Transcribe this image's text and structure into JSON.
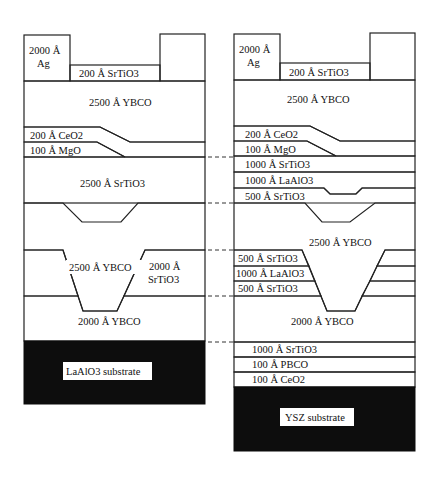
{
  "colors": {
    "hatch": "#555555",
    "substrate": "#0d0d0d",
    "background": "#ffffff",
    "line": "#222222"
  },
  "left_stack": {
    "ag": "2000 Å",
    "ag_material": "Ag",
    "top_srtio3": "200 Å SrTiO3",
    "top_ybco": "2500 Å YBCO",
    "ceo2": "200 Å CeO2",
    "mgo": "100 Å MgO",
    "mid_srtio3": "2500 Å SrTiO3",
    "mid_ybco": "2500 Å YBCO",
    "insulator_thickness": "2000 Å",
    "insulator_material": "SrTiO3",
    "bottom_ybco": "2000 Å YBCO",
    "substrate": "LaAlO3 substrate"
  },
  "right_stack": {
    "ag": "2000 Å",
    "ag_material": "Ag",
    "top_srtio3": "200 Å SrTiO3",
    "top_ybco": "2500 Å YBCO",
    "ceo2": "200 Å CeO2",
    "mgo": "100 Å MgO",
    "srtio3_a": "1000 Å SrTiO3",
    "laalo3_a": "1000 Å LaAlO3",
    "srtio3_b": "500 Å SrTiO3",
    "mid_ybco": "2500 Å YBCO",
    "srtio3_c": "500 Å SrTiO3",
    "laalo3_b": "1000 Å LaAlO3",
    "srtio3_d": "500 Å SrTiO3",
    "bottom_ybco": "2000 Å YBCO",
    "buffer_srtio3": "1000 Å SrTiO3",
    "pbco": "100 Å PBCO",
    "buffer_ceo2": "100 Å CeO2",
    "substrate": "YSZ substrate"
  }
}
